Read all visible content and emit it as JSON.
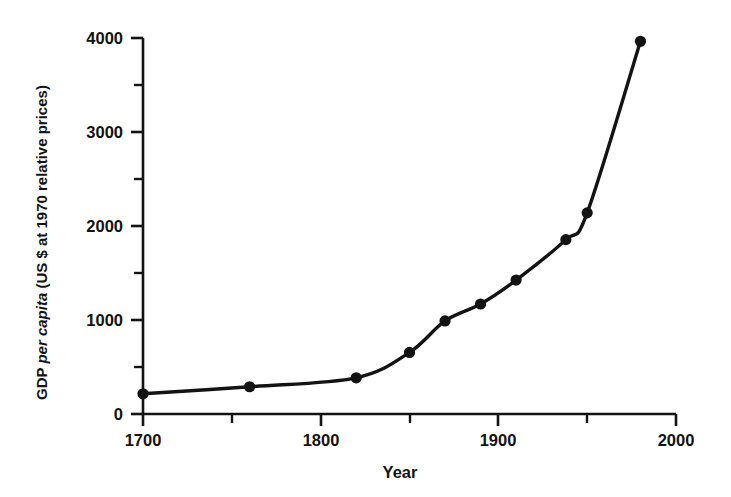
{
  "figure": {
    "background_color": "#ffffff",
    "ink_color": "#131313"
  },
  "axes": {
    "x": {
      "title": "Year",
      "major_ticks": [
        "1700",
        "1800",
        "1900",
        "2000"
      ],
      "major_tick_values": [
        1700,
        1800,
        1900,
        2000
      ],
      "minor_tick_values": [
        1750,
        1850,
        1950
      ],
      "range": [
        1700,
        2000
      ]
    },
    "y": {
      "title_parts": {
        "lead": "GDP ",
        "italic": "per capita",
        "trail": " (US $ at 1970 relative prices)"
      },
      "title_full": "GDP per capita (US $ at 1970 relative prices)",
      "major_ticks": [
        "0",
        "1000",
        "2000",
        "3000",
        "4000"
      ],
      "major_tick_values": [
        0,
        1000,
        2000,
        3000,
        4000
      ],
      "minor_tick_values": [
        500,
        1500,
        2500,
        3500
      ],
      "range": [
        0,
        4000
      ]
    }
  },
  "chart_data": {
    "type": "line",
    "title": "",
    "xlabel": "Year",
    "ylabel": "GDP per capita (US $ at 1970 relative prices)",
    "xlim": [
      1700,
      2000
    ],
    "ylim": [
      0,
      4000
    ],
    "grid": false,
    "legend": null,
    "markers": "filled-circle",
    "x": [
      1700,
      1760,
      1820,
      1850,
      1870,
      1890,
      1910,
      1938,
      1950,
      1980
    ],
    "values": [
      215,
      290,
      385,
      655,
      990,
      1170,
      1425,
      1855,
      2140,
      3965
    ],
    "points": [
      {
        "x": 1700,
        "y": 215
      },
      {
        "x": 1760,
        "y": 290
      },
      {
        "x": 1820,
        "y": 385
      },
      {
        "x": 1850,
        "y": 655
      },
      {
        "x": 1870,
        "y": 990
      },
      {
        "x": 1890,
        "y": 1170
      },
      {
        "x": 1910,
        "y": 1425
      },
      {
        "x": 1938,
        "y": 1855
      },
      {
        "x": 1950,
        "y": 2140
      },
      {
        "x": 1980,
        "y": 3965
      }
    ]
  }
}
